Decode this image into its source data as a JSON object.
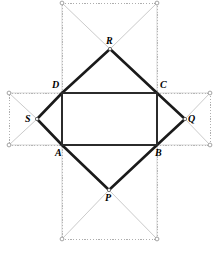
{
  "figure": {
    "canvas": {
      "width": 213,
      "height": 253,
      "background": "#ffffff"
    },
    "colors": {
      "heavy_stroke": "#1a1a1a",
      "rect_stroke": "#2b2b2b",
      "dotted_stroke": "#9a9a9a",
      "faint_diagonal": "#bcbcbc",
      "node_fill": "#ffffff",
      "node_stroke": "#8d8d8d",
      "label_color": "#000000"
    },
    "stroke_widths": {
      "heavy": 2.6,
      "rect": 1.5,
      "dotted": 0.8,
      "faint": 0.8
    }
  },
  "points": {
    "A": {
      "label": "A",
      "x": 62,
      "y": 145,
      "label_x": 55,
      "label_y": 148
    },
    "B": {
      "label": "B",
      "x": 157,
      "y": 145,
      "label_x": 155,
      "label_y": 148
    },
    "C": {
      "label": "C",
      "x": 157,
      "y": 93,
      "label_x": 160,
      "label_y": 80
    },
    "D": {
      "label": "D",
      "x": 62,
      "y": 93,
      "label_x": 52,
      "label_y": 80
    },
    "P": {
      "label": "P",
      "x": 109,
      "y": 190,
      "label_x": 105,
      "label_y": 193
    },
    "Q": {
      "label": "Q",
      "x": 185,
      "y": 119,
      "label_x": 188,
      "label_y": 114
    },
    "R": {
      "label": "R",
      "x": 110,
      "y": 49,
      "label_x": 106,
      "label_y": 36
    },
    "S": {
      "label": "S",
      "x": 37,
      "y": 119,
      "label_x": 25,
      "label_y": 114
    }
  },
  "inner_rectangle": {
    "name": "ABCD",
    "vertex_order": [
      "A",
      "B",
      "C",
      "D"
    ],
    "width_px": 95,
    "height_px": 52
  },
  "triangles": [
    {
      "name": "triangle-R-on-DC",
      "apex": "R",
      "base": [
        "D",
        "C"
      ],
      "side": "top",
      "stroke": "heavy"
    },
    {
      "name": "triangle-Q-on-CB",
      "apex": "Q",
      "base": [
        "C",
        "B"
      ],
      "side": "right",
      "stroke": "heavy"
    },
    {
      "name": "triangle-P-on-AB",
      "apex": "P",
      "base": [
        "A",
        "B"
      ],
      "side": "bottom",
      "stroke": "heavy"
    },
    {
      "name": "triangle-S-on-DA",
      "apex": "S",
      "base": [
        "D",
        "A"
      ],
      "side": "left",
      "stroke": "heavy"
    }
  ],
  "construction_squares": [
    {
      "name": "square-top",
      "apex": "R",
      "corners": [
        {
          "x": 62,
          "y": 3
        },
        {
          "x": 157,
          "y": 3
        },
        {
          "x": 157,
          "y": 93
        },
        {
          "x": 62,
          "y": 93
        }
      ],
      "diagonals_to_apex": [
        {
          "x": 62,
          "y": 3
        },
        {
          "x": 157,
          "y": 3
        }
      ],
      "nodes": [
        {
          "x": 62,
          "y": 3
        },
        {
          "x": 157,
          "y": 3
        }
      ]
    },
    {
      "name": "square-bottom",
      "apex": "P",
      "corners": [
        {
          "x": 62,
          "y": 145
        },
        {
          "x": 157,
          "y": 145
        },
        {
          "x": 157,
          "y": 239
        },
        {
          "x": 62,
          "y": 239
        }
      ],
      "diagonals_to_apex": [
        {
          "x": 62,
          "y": 239
        },
        {
          "x": 157,
          "y": 239
        }
      ],
      "nodes": [
        {
          "x": 62,
          "y": 239
        },
        {
          "x": 157,
          "y": 239
        }
      ]
    },
    {
      "name": "square-left",
      "apex": "S",
      "corners": [
        {
          "x": 9,
          "y": 93
        },
        {
          "x": 62,
          "y": 93
        },
        {
          "x": 62,
          "y": 145
        },
        {
          "x": 9,
          "y": 145
        }
      ],
      "diagonals_to_apex": [
        {
          "x": 9,
          "y": 93
        },
        {
          "x": 9,
          "y": 145
        }
      ],
      "nodes": [
        {
          "x": 9,
          "y": 93
        },
        {
          "x": 9,
          "y": 145
        }
      ]
    },
    {
      "name": "square-right",
      "apex": "Q",
      "corners": [
        {
          "x": 157,
          "y": 93
        },
        {
          "x": 210,
          "y": 93
        },
        {
          "x": 210,
          "y": 145
        },
        {
          "x": 157,
          "y": 145
        }
      ],
      "diagonals_to_apex": [
        {
          "x": 210,
          "y": 93
        },
        {
          "x": 210,
          "y": 145
        }
      ],
      "nodes": [
        {
          "x": 210,
          "y": 93
        },
        {
          "x": 210,
          "y": 145
        }
      ]
    }
  ]
}
